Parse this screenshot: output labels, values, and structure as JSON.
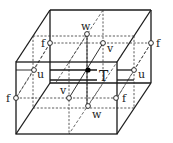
{
  "diagram": {
    "center_label": "T",
    "labels": {
      "w_top": "w",
      "w_bottom": "w",
      "v_back": "v",
      "v_front": "v",
      "f_back_left": "f",
      "f_back_right": "f",
      "f_front_left": "f",
      "f_front_right": "f",
      "u_left": "u",
      "u_right": "u"
    },
    "colors": {
      "line": "#1a1a1a",
      "node_fill": "#ffffff",
      "center_fill": "#000000"
    }
  }
}
